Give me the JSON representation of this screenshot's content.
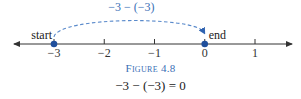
{
  "figure": {
    "type": "number-line",
    "range": [
      -3.6,
      1.6
    ],
    "ticks": [
      {
        "value": -3,
        "label": "−3"
      },
      {
        "value": -2,
        "label": "−2"
      },
      {
        "value": -1,
        "label": "−1"
      },
      {
        "value": 0,
        "label": "0"
      },
      {
        "value": 1,
        "label": "1"
      }
    ],
    "points": [
      {
        "value": -3,
        "label": "start",
        "label_side": "left"
      },
      {
        "value": 0,
        "label": "end",
        "label_side": "right"
      }
    ],
    "arc": {
      "from": -3,
      "to": 0,
      "style": "dashed",
      "label": "−3 − (−3)"
    },
    "colors": {
      "accent": "#1f4f9c",
      "arc": "#5a8acb",
      "axis": "#333333",
      "caption": "#3a6fb6"
    }
  },
  "caption": "Figure 4.8",
  "equation": "−3 − (−3) = 0"
}
